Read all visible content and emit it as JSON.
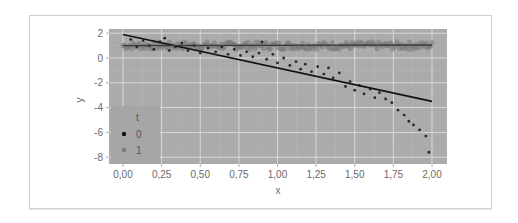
{
  "chart_data": {
    "type": "scatter",
    "title": "",
    "xlabel": "x",
    "ylabel": "y",
    "xlim": [
      -0.09,
      2.09
    ],
    "ylim": [
      -8.5,
      2.35
    ],
    "x_ticks": [
      "0,00",
      "0,25",
      "0,50",
      "0,75",
      "1,00",
      "1,25",
      "1,50",
      "1,75",
      "2,00"
    ],
    "x_tick_values": [
      0,
      0.25,
      0.5,
      0.75,
      1.0,
      1.25,
      1.5,
      1.75,
      2.0
    ],
    "y_ticks": [
      "2",
      "0",
      "-2",
      "-4",
      "-6",
      "-8"
    ],
    "y_tick_values": [
      2,
      0,
      -2,
      -4,
      -6,
      -8
    ],
    "grid": true,
    "legend": {
      "title": "t",
      "position": "inside-bottom-left",
      "entries": [
        {
          "label": "0",
          "color": "#111111"
        },
        {
          "label": "1",
          "color": "#7a7a7a"
        }
      ]
    },
    "series": [
      {
        "name": "0",
        "color": "#111111",
        "points": [
          [
            0.05,
            1.5
          ],
          [
            0.09,
            0.9
          ],
          [
            0.13,
            1.4
          ],
          [
            0.17,
            1.0
          ],
          [
            0.2,
            0.7
          ],
          [
            0.24,
            1.3
          ],
          [
            0.27,
            1.6
          ],
          [
            0.3,
            0.6
          ],
          [
            0.34,
            0.9
          ],
          [
            0.38,
            1.2
          ],
          [
            0.42,
            0.6
          ],
          [
            0.46,
            1.0
          ],
          [
            0.5,
            0.4
          ],
          [
            0.55,
            0.8
          ],
          [
            0.6,
            0.5
          ],
          [
            0.64,
            0.9
          ],
          [
            0.68,
            0.3
          ],
          [
            0.72,
            0.7
          ],
          [
            0.76,
            0.2
          ],
          [
            0.8,
            0.5
          ],
          [
            0.84,
            0.1
          ],
          [
            0.88,
            0.4
          ],
          [
            0.9,
            1.3
          ],
          [
            0.93,
            -0.1
          ],
          [
            0.97,
            0.3
          ],
          [
            1.0,
            -0.4
          ],
          [
            1.04,
            0.0
          ],
          [
            1.08,
            -0.6
          ],
          [
            1.12,
            -0.3
          ],
          [
            1.15,
            -0.9
          ],
          [
            1.18,
            -0.5
          ],
          [
            1.22,
            -1.1
          ],
          [
            1.26,
            -0.7
          ],
          [
            1.3,
            -1.3
          ],
          [
            1.33,
            -0.8
          ],
          [
            1.36,
            -1.6
          ],
          [
            1.4,
            -1.2
          ],
          [
            1.44,
            -2.3
          ],
          [
            1.47,
            -1.9
          ],
          [
            1.5,
            -2.6
          ],
          [
            1.53,
            -2.2
          ],
          [
            1.56,
            -2.9
          ],
          [
            1.6,
            -2.5
          ],
          [
            1.63,
            -3.2
          ],
          [
            1.66,
            -2.8
          ],
          [
            1.7,
            -3.3
          ],
          [
            1.74,
            -3.6
          ],
          [
            1.78,
            -4.2
          ],
          [
            1.82,
            -4.6
          ],
          [
            1.85,
            -5.1
          ],
          [
            1.88,
            -5.4
          ],
          [
            1.92,
            -5.8
          ],
          [
            1.96,
            -6.3
          ],
          [
            1.98,
            -7.6
          ]
        ],
        "fit_line": {
          "x": [
            0,
            2
          ],
          "y": [
            1.9,
            -3.5
          ]
        }
      },
      {
        "name": "1",
        "color": "#7a7a7a",
        "description": "dense band of points centered near y=1 across x 0..2",
        "y_center": 1.0,
        "y_spread": 0.3,
        "fit_line": {
          "x": [
            0,
            2
          ],
          "y": [
            1.0,
            1.05
          ]
        }
      }
    ]
  }
}
